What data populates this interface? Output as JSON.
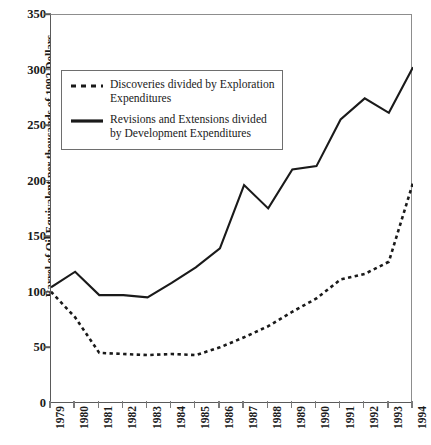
{
  "chart_data": {
    "type": "line",
    "title": "",
    "xlabel": "",
    "ylabel": "Barrel of Oil Equivalent per thousands of 1992 Dollars",
    "categories": [
      "1979",
      "1980",
      "1981",
      "1982",
      "1983",
      "1984",
      "1985",
      "1986",
      "1987",
      "1988",
      "1989",
      "1990",
      "1991",
      "1992",
      "1993",
      "1994"
    ],
    "x": [
      1979,
      1980,
      1981,
      1982,
      1983,
      1984,
      1985,
      1986,
      1987,
      1988,
      1989,
      1990,
      1991,
      1992,
      1993,
      1994
    ],
    "ylim": [
      0,
      350
    ],
    "yticks": [
      0,
      50,
      100,
      150,
      200,
      250,
      300,
      350
    ],
    "grid": false,
    "legend_position": "upper-left",
    "series": [
      {
        "name": "Discoveries divided by Exploration Expenditures",
        "style": "dashed",
        "color": "#1a1a1a",
        "values": [
          101,
          78,
          46,
          45,
          44,
          45,
          44,
          51,
          60,
          70,
          83,
          95,
          112,
          117,
          128,
          199
        ]
      },
      {
        "name": "Revisions and Extensions divided by Development Expenditures",
        "style": "solid",
        "color": "#1a1a1a",
        "values": [
          105,
          119,
          98,
          98,
          96,
          109,
          123,
          140,
          197,
          176,
          211,
          214,
          256,
          275,
          262,
          303
        ]
      }
    ]
  },
  "legend": {
    "entries": [
      {
        "sample": "dashed-line-sample",
        "label": "Discoveries divided by Exploration Expenditures"
      },
      {
        "sample": "solid-line-sample",
        "label": "Revisions and Extensions divided by Development Expenditures"
      }
    ]
  },
  "axes": {
    "y_title": "Barrel of Oil Equivalent per thousands of 1992 Dollars",
    "y_tick_labels": [
      "0",
      "50",
      "100",
      "150",
      "200",
      "250",
      "300",
      "350"
    ],
    "x_tick_labels": [
      "1979",
      "1980",
      "1981",
      "1982",
      "1983",
      "1984",
      "1985",
      "1986",
      "1987",
      "1988",
      "1989",
      "1990",
      "1991",
      "1992",
      "1993",
      "1994"
    ]
  },
  "colors": {
    "axis": "#5a5a5a",
    "series": "#1a1a1a",
    "background": "#ffffff",
    "legend_border": "#6e6e6e"
  }
}
